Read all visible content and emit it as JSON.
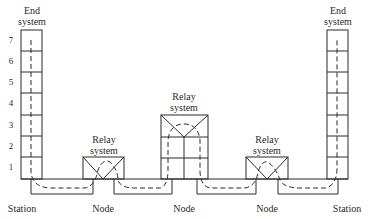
{
  "diagram": {
    "type": "network-relay-layers",
    "layer_numbers": [
      "7",
      "6",
      "5",
      "4",
      "3",
      "2",
      "1"
    ],
    "labels": {
      "end_system_left": [
        "End",
        "system"
      ],
      "end_system_right": [
        "End",
        "system"
      ],
      "relay_1": [
        "Relay",
        "system"
      ],
      "relay_2": [
        "Relay",
        "system"
      ],
      "relay_3": [
        "Relay",
        "system"
      ],
      "station_left": "Station",
      "node_1": "Node",
      "node_2": "Node",
      "node_3": "Node",
      "station_right": "Station"
    },
    "colors": {
      "line": "#2a2a2a",
      "background": "#ffffff"
    }
  }
}
